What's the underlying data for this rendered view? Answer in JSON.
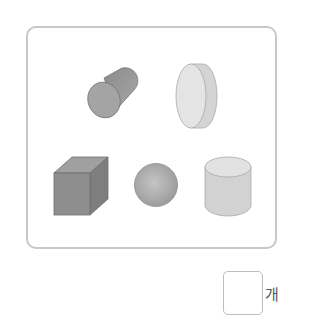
{
  "problem": {
    "shapes": [
      {
        "name": "cylinder-tilted",
        "color": "#9c9c9c"
      },
      {
        "name": "disc-cylinder",
        "color": "#e0e0e0"
      },
      {
        "name": "cube",
        "color": "#8e8e8e"
      },
      {
        "name": "sphere",
        "color": "#acacac"
      },
      {
        "name": "cylinder-upright",
        "color": "#d6d6d6"
      }
    ],
    "answer": {
      "value": "",
      "unit": "개"
    }
  }
}
